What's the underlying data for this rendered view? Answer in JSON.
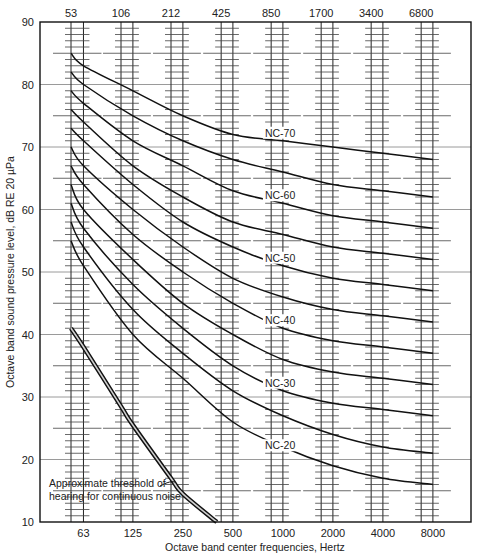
{
  "chart_data": {
    "type": "line",
    "title": "",
    "xlabel": "Octave band center frequencies, Hertz",
    "ylabel": "Octave band sound pressure level, dB RE 20 µPa",
    "ylim": [
      10,
      90
    ],
    "yticks": [
      10,
      20,
      30,
      40,
      50,
      60,
      70,
      80,
      90
    ],
    "x_bottom_ticks": [
      "63",
      "125",
      "250",
      "500",
      "1000",
      "2000",
      "4000",
      "8000"
    ],
    "x_top_ticks": [
      "53",
      "106",
      "212",
      "425",
      "850",
      "1700",
      "3400",
      "6800"
    ],
    "grid": true,
    "x": [
      53,
      63,
      125,
      250,
      500,
      1000,
      2000,
      4000,
      8000
    ],
    "series": [
      {
        "name": "NC-70",
        "label": "NC-70",
        "values": [
          85,
          83,
          79,
          75,
          72,
          71,
          70,
          69,
          68
        ]
      },
      {
        "name": "NC-65",
        "label": "",
        "values": [
          82,
          80,
          75,
          71,
          68,
          66,
          64,
          63,
          62
        ]
      },
      {
        "name": "NC-60",
        "label": "NC-60",
        "values": [
          79,
          77,
          71,
          67,
          63,
          61,
          59,
          58,
          57
        ]
      },
      {
        "name": "NC-55",
        "label": "",
        "values": [
          76,
          74,
          67,
          62,
          58,
          56,
          54,
          53,
          52
        ]
      },
      {
        "name": "NC-50",
        "label": "NC-50",
        "values": [
          73,
          71,
          64,
          58,
          54,
          51,
          49,
          48,
          47
        ]
      },
      {
        "name": "NC-45",
        "label": "",
        "values": [
          70,
          67,
          60,
          54,
          49,
          46,
          44,
          43,
          42
        ]
      },
      {
        "name": "NC-40",
        "label": "NC-40",
        "values": [
          67,
          64,
          56,
          50,
          45,
          41,
          39,
          38,
          37
        ]
      },
      {
        "name": "NC-35",
        "label": "",
        "values": [
          64,
          60,
          52,
          45,
          40,
          36,
          34,
          33,
          32
        ]
      },
      {
        "name": "NC-30",
        "label": "NC-30",
        "values": [
          61,
          57,
          48,
          41,
          35,
          31,
          29,
          28,
          27
        ]
      },
      {
        "name": "NC-25",
        "label": "",
        "values": [
          58,
          54,
          44,
          37,
          31,
          27,
          24,
          22,
          21
        ]
      },
      {
        "name": "NC-20",
        "label": "NC-20",
        "values": [
          55,
          51,
          40,
          33,
          26,
          22,
          19,
          17,
          16
        ]
      }
    ],
    "threshold_curve": {
      "label_line1": "Approximate threshold of",
      "label_line2": "hearing for continuous noise",
      "points": [
        [
          53,
          41
        ],
        [
          63,
          38
        ],
        [
          106,
          28.5
        ],
        [
          125,
          25.5
        ],
        [
          212,
          17
        ],
        [
          250,
          14.5
        ],
        [
          400,
          10
        ]
      ]
    },
    "curve_labels": [
      {
        "text": "NC-70",
        "x_freq": 1000,
        "y": 71.8
      },
      {
        "text": "NC-60",
        "x_freq": 1000,
        "y": 61.8
      },
      {
        "text": "NC-50",
        "x_freq": 1000,
        "y": 51.8
      },
      {
        "text": "NC-40",
        "x_freq": 1000,
        "y": 41.8
      },
      {
        "text": "NC-30",
        "x_freq": 1000,
        "y": 31.8
      },
      {
        "text": "NC-20",
        "x_freq": 1000,
        "y": 21.8
      }
    ]
  }
}
